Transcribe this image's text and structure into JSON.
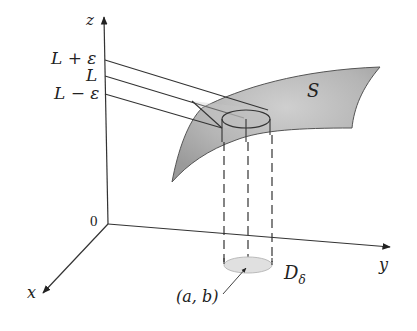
{
  "figure": {
    "axes": {
      "z_label": "z",
      "y_label": "y",
      "x_label": "x",
      "origin_label": "0"
    },
    "z_levels": {
      "upper": "L + ε",
      "middle": "L",
      "lower": "L − ε"
    },
    "surface_label": "S",
    "disk_label": "D",
    "disk_subscript": "δ",
    "point_label": "(a, b)",
    "colors": {
      "surface_fill": "#a9a9a9",
      "surface_highlight": "#d4d4d4",
      "disk_fill": "#dcdcdc",
      "line": "#333333"
    }
  }
}
